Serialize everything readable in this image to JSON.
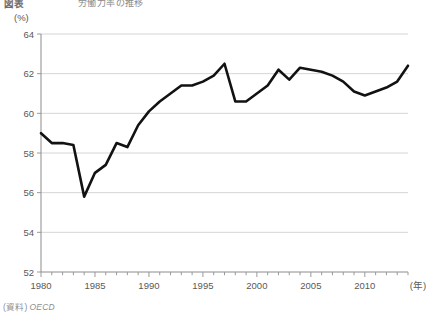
{
  "title": {
    "main": "図表",
    "sub": "労働力率の推移"
  },
  "unit_label": "(%)",
  "source": {
    "label": "(資料)",
    "value": "OECD"
  },
  "axis": {
    "x_unit_label": "(年)",
    "y_ticks": [
      "52",
      "54",
      "56",
      "58",
      "60",
      "62",
      "64"
    ],
    "x_ticks": [
      "1980",
      "1985",
      "1990",
      "1995",
      "2000",
      "2005",
      "2010"
    ]
  },
  "chart_data": {
    "type": "line",
    "title": "労働力率の推移",
    "xlabel": "(年)",
    "ylabel": "(%)",
    "xlim": [
      1980,
      2014
    ],
    "ylim": [
      52,
      64
    ],
    "ytick_step": 2,
    "xtick_step": 5,
    "grid": true,
    "legend": "none",
    "line_color": "#121212",
    "line_width": 2.6,
    "markers": false,
    "x": [
      1980,
      1981,
      1982,
      1983,
      1984,
      1985,
      1986,
      1987,
      1988,
      1989,
      1990,
      1991,
      1992,
      1993,
      1994,
      1995,
      1996,
      1997,
      1998,
      1999,
      2000,
      2001,
      2002,
      2003,
      2004,
      2005,
      2006,
      2007,
      2008,
      2009,
      2010,
      2011,
      2012,
      2013,
      2014
    ],
    "values": [
      59.0,
      58.5,
      58.5,
      58.4,
      55.8,
      57.0,
      57.4,
      58.5,
      58.3,
      59.4,
      60.1,
      60.6,
      61.0,
      61.4,
      61.4,
      61.6,
      61.9,
      62.5,
      60.6,
      60.6,
      61.0,
      61.4,
      62.2,
      61.7,
      62.3,
      62.2,
      62.1,
      61.9,
      61.6,
      61.1,
      60.9,
      61.1,
      61.3,
      61.6,
      62.4
    ]
  }
}
